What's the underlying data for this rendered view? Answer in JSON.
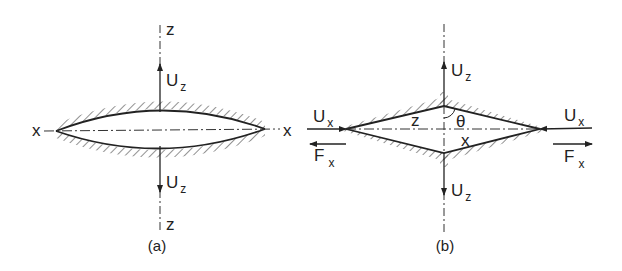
{
  "figure": {
    "panel_a": {
      "caption": "(a)",
      "axis_z_top": "z",
      "axis_z_bottom": "z",
      "axis_x_left": "x",
      "axis_x_right": "x",
      "uz_top": {
        "main": "U",
        "sub": "z"
      },
      "uz_bottom": {
        "main": "U",
        "sub": "z"
      },
      "shape": "lens (curved crack faces)"
    },
    "panel_b": {
      "caption": "(b)",
      "ux_left": {
        "main": "U",
        "sub": "x"
      },
      "fx_left": {
        "main": "F",
        "sub": "x"
      },
      "ux_right": {
        "main": "U",
        "sub": "x"
      },
      "fx_right": {
        "main": "F",
        "sub": "x"
      },
      "uz_top": {
        "main": "U",
        "sub": "z"
      },
      "uz_bottom": {
        "main": "U",
        "sub": "z"
      },
      "label_z": "z",
      "label_x": "x",
      "angle": "θ",
      "shape": "rhombus (straight crack faces)"
    },
    "colors": {
      "line": "#222222",
      "hatch": "#555555",
      "background": "#ffffff"
    }
  }
}
